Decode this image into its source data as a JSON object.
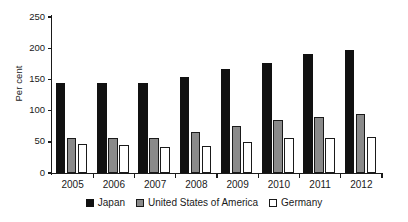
{
  "chart_data": {
    "type": "bar",
    "title": "",
    "subtitle": "",
    "xlabel": "",
    "ylabel": "Per cent",
    "categories": [
      "2005",
      "2006",
      "2007",
      "2008",
      "2009",
      "2010",
      "2011",
      "2012"
    ],
    "series": [
      {
        "name": "Japan",
        "color": "#111111",
        "values": [
          144,
          145,
          144,
          154,
          167,
          176,
          190,
          197
        ]
      },
      {
        "name": "United States of America",
        "color": "#8a8a8a",
        "values": [
          56,
          56,
          56,
          65,
          76,
          85,
          90,
          95
        ]
      },
      {
        "name": "Germany",
        "color": "#ffffff",
        "values": [
          46,
          45,
          42,
          43,
          50,
          56,
          56,
          57
        ]
      }
    ],
    "ylim": [
      0,
      250
    ],
    "yticks": [
      0,
      50,
      100,
      150,
      200,
      250
    ],
    "ytick_labels": [
      "0",
      "50",
      "100",
      "150",
      "200",
      "250"
    ],
    "grid": false,
    "legend_position": "bottom"
  }
}
